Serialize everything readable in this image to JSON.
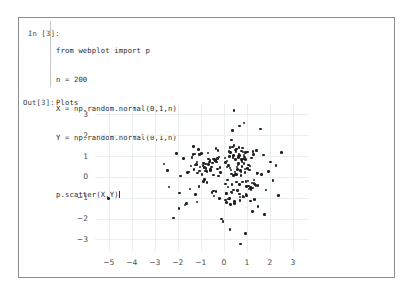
{
  "notebook": {
    "input_prompt": "In [3]:",
    "output_prompt": "Out[3]:",
    "code_lines": [
      "from webplot import p",
      "n = 200",
      "X = np.random.normal(0,1,n)",
      "Y = np.random.normal(0,1,n)",
      "",
      "p.scatter(X,Y)"
    ],
    "output_text": "Plots"
  },
  "chart_data": {
    "type": "scatter",
    "title": "",
    "xlabel": "",
    "ylabel": "",
    "xlim": [
      -5.6,
      3.7
    ],
    "ylim": [
      -3.6,
      3.5
    ],
    "xticks": [
      -5,
      -4,
      -3,
      -2,
      -1,
      0,
      1,
      2,
      3
    ],
    "xticklabels": [
      "−5",
      "−4",
      "−3",
      "−2",
      "−1",
      "0",
      "1",
      "2",
      "3"
    ],
    "yticks": [
      3,
      2,
      1,
      0,
      -1,
      -2,
      -3
    ],
    "yticklabels": [
      "3",
      "2",
      "1",
      "0",
      "−1",
      "−2",
      "−3"
    ],
    "grid": true,
    "legend": false,
    "marker_color": "#231f20",
    "grid_color": "#e9eef0",
    "n_points": 200,
    "series": [
      {
        "name": "scatter",
        "x": [
          -0.17,
          0.52,
          -0.45,
          1.12,
          0.33,
          -0.88,
          0.05,
          0.71,
          -1.23,
          0.42,
          0.96,
          -0.34,
          1.45,
          -0.62,
          0.18,
          0.87,
          -1.05,
          0.29,
          0.63,
          -0.21,
          1.31,
          -0.77,
          0.44,
          0.09,
          -1.52,
          0.68,
          1.02,
          -0.41,
          0.25,
          0.79,
          -0.95,
          1.18,
          0.37,
          -0.58,
          0.84,
          0.13,
          -1.34,
          0.56,
          1.07,
          -0.28,
          0.46,
          0.91,
          -0.69,
          1.25,
          -0.15,
          0.61,
          0.32,
          -1.11,
          0.74,
          1.39,
          -0.49,
          0.22,
          0.98,
          -0.83,
          0.51,
          1.16,
          -0.36,
          0.66,
          0.07,
          -1.42,
          0.89,
          0.41,
          -0.73,
          1.28,
          0.19,
          -0.54,
          0.77,
          1.05,
          -0.26,
          0.58,
          0.35,
          -1.19,
          0.93,
          1.48,
          -0.44,
          0.64,
          0.11,
          -0.91,
          0.81,
          1.22,
          -0.31,
          0.49,
          0.86,
          -1.27,
          0.27,
          1.09,
          -0.66,
          0.53,
          0.16,
          -0.79,
          0.72,
          1.34,
          -0.38,
          0.43,
          0.99,
          -1.14,
          0.24,
          0.68,
          1.41,
          -0.57,
          0.82,
          0.06,
          -0.97,
          0.59,
          1.13,
          -0.23,
          0.47,
          0.94,
          -1.31,
          0.36,
          0.75,
          1.19,
          -0.51,
          0.65,
          0.14,
          -0.85,
          0.88,
          1.26,
          -0.42,
          0.31,
          0.55,
          -1.08,
          0.78,
          1.44,
          -0.19,
          0.62,
          0.29,
          -0.74,
          0.85,
          1.03,
          -0.35,
          0.48,
          0.92,
          -1.22,
          0.21,
          0.69,
          1.36,
          -0.61,
          0.54,
          0.08,
          -0.89,
          0.76,
          1.15,
          -0.27,
          0.39,
          0.97,
          -1.05,
          0.57,
          0.12,
          -0.68,
          0.83,
          1.31,
          -0.46,
          0.34,
          0.71,
          -1.17,
          0.26,
          1.06,
          -0.81,
          0.51,
          -5.02,
          -2.61,
          -2.44,
          -2.38,
          -2.05,
          -1.92,
          -1.88,
          -1.76,
          -1.68,
          -1.59,
          -1.47,
          -1.38,
          -1.29,
          -1.16,
          -1.04,
          2.02,
          2.14,
          2.26,
          2.38,
          2.51,
          1.93,
          1.84,
          1.72,
          1.64,
          -1.95,
          -2.18,
          0.44,
          0.67,
          1.58,
          0.88,
          -0.03,
          0.27,
          1.77,
          -1.62,
          0.95,
          1.49,
          0.72,
          -0.11,
          0.38,
          1.24
        ],
        "y": [
          0.45,
          1.23,
          -0.67,
          0.34,
          1.78,
          -0.22,
          0.91,
          -1.14,
          0.58,
          0.07,
          -0.83,
          1.36,
          0.19,
          0.72,
          -0.49,
          1.05,
          0.28,
          -1.31,
          0.64,
          0.96,
          -0.15,
          0.41,
          1.52,
          -0.78,
          0.23,
          -0.36,
          1.19,
          0.85,
          -1.02,
          0.51,
          0.13,
          -0.61,
          1.44,
          0.32,
          -0.94,
          0.76,
          1.08,
          -0.25,
          0.57,
          0.89,
          -1.27,
          0.38,
          1.15,
          -0.53,
          0.21,
          0.98,
          -0.72,
          1.33,
          0.06,
          -0.41,
          0.67,
          1.21,
          -0.88,
          0.44,
          0.12,
          -1.16,
          0.79,
          1.42,
          -0.34,
          0.53,
          0.95,
          -0.63,
          0.27,
          1.09,
          -1.05,
          0.48,
          0.84,
          -0.19,
          1.28,
          0.36,
          -0.77,
          0.61,
          1.17,
          -0.42,
          0.09,
          0.92,
          -1.23,
          0.55,
          1.38,
          -0.29,
          0.71,
          0.24,
          -0.96,
          1.11,
          0.43,
          -0.58,
          0.87,
          1.31,
          -0.14,
          0.62,
          0.31,
          -1.08,
          0.78,
          1.04,
          -0.47,
          0.18,
          0.99,
          -0.81,
          1.26,
          0.39,
          -0.24,
          0.68,
          1.13,
          -0.66,
          0.52,
          0.05,
          -1.19,
          0.83,
          1.45,
          -0.37,
          0.26,
          0.91,
          -0.74,
          1.07,
          0.47,
          -0.11,
          0.64,
          1.22,
          -0.92,
          0.33,
          1.34,
          -0.46,
          0.75,
          0.17,
          -1.03,
          0.58,
          1.16,
          -0.28,
          0.86,
          0.41,
          -0.69,
          1.29,
          0.22,
          -0.85,
          0.54,
          1.02,
          -0.36,
          0.79,
          0.13,
          -1.11,
          0.66,
          1.24,
          -0.51,
          0.38,
          0.94,
          -0.23,
          1.07,
          0.48,
          -0.78,
          0.61,
          1.19,
          -0.32,
          0.87,
          0.15,
          -0.97,
          0.72,
          1.41,
          -0.44,
          0.29,
          0.83,
          -1.02,
          0.62,
          0.31,
          -0.48,
          1.12,
          -0.77,
          0.04,
          0.88,
          -1.34,
          0.21,
          -0.58,
          0.93,
          0.36,
          -1.21,
          0.47,
          0.72,
          -0.16,
          0.55,
          -0.89,
          1.18,
          0.26,
          -0.63,
          1.05,
          0.12,
          -1.52,
          -1.97,
          3.18,
          2.44,
          2.31,
          2.58,
          -2.14,
          -2.52,
          -1.81,
          -1.28,
          -2.71,
          -1.43,
          -3.21,
          -2.02,
          2.22,
          -1.66
        ]
      }
    ]
  }
}
